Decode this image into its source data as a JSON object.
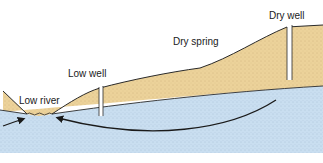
{
  "diagram": {
    "type": "cross-section",
    "colors": {
      "soil": "#ecd29a",
      "groundwater": "#c9def0",
      "outline": "#2a2a2a",
      "arrow": "#1a1a1a",
      "background": "#ffffff"
    },
    "labels": {
      "low_river": "Low river",
      "low_well": "Low well",
      "dry_spring": "Dry spring",
      "dry_well": "Dry well"
    }
  }
}
